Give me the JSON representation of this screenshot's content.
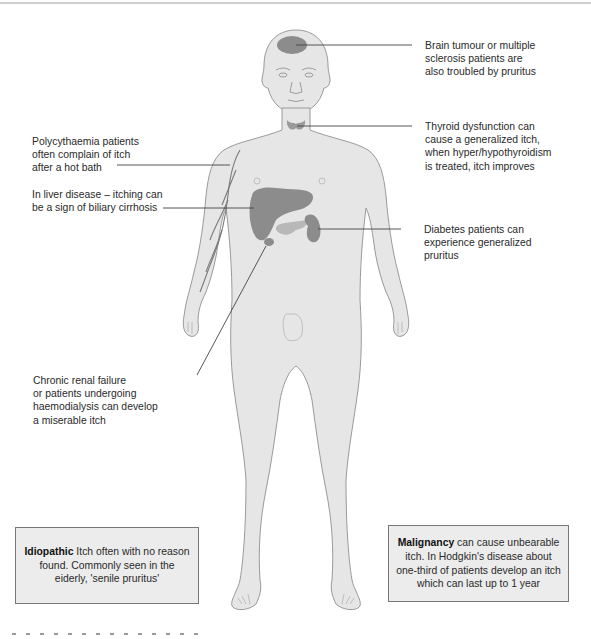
{
  "figure": {
    "colors": {
      "skin": "#e6e6e6",
      "outline": "#9a9a9a",
      "organ_dark": "#8c8c8c",
      "organ_light": "#b8b8b8",
      "leader_line": "#444444",
      "box_fill": "#ececec",
      "box_border": "#777777"
    }
  },
  "annotations": {
    "brain": [
      "Brain tumour or multiple",
      "sclerosis patients are",
      "also troubled by pruritus"
    ],
    "thyroid": [
      "Thyroid dysfunction can",
      "cause a generalized itch,",
      "when hyper/hypothyroidism",
      "is treated, itch improves"
    ],
    "polycythaemia": [
      "Polycythaemia patients",
      "often complain of itch",
      "after a hot bath"
    ],
    "liver": [
      "In liver disease – itching can",
      "be a sign of biliary cirrhosis"
    ],
    "diabetes": [
      "Diabetes patients can",
      "experience generalized",
      "pruritus"
    ],
    "renal": [
      "Chronic renal failure",
      "or patients undergoing",
      "haemodialysis can develop",
      "a miserable itch"
    ]
  },
  "boxes": {
    "idiopathic": {
      "bold": "Idiopathic",
      "text": " Itch often with no reason found. Commonly seen in the eiderly, 'senile pruritus'"
    },
    "malignancy": {
      "bold": "Malignancy",
      "text": " can cause unbearable itch. In Hodgkin's disease about one-third of patients develop an itch which can last up to 1 year"
    }
  }
}
